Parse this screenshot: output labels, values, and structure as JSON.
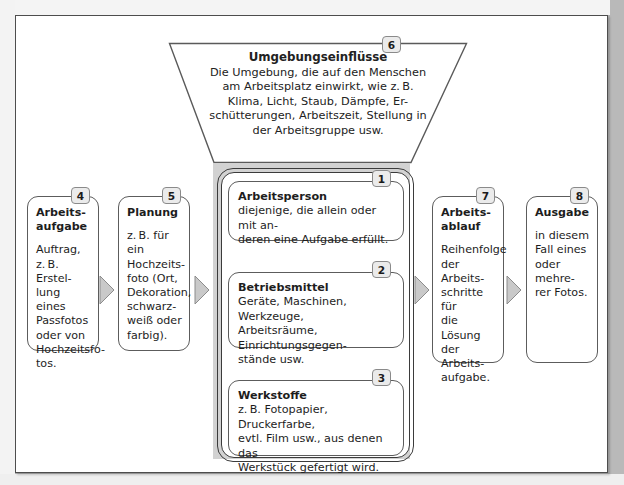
{
  "diagram": {
    "title_semantic": "arbeitssystem-diagramm",
    "colors": {
      "page_background": "#b4b4b4",
      "sheet": "#ffffff",
      "band_gray": "#d2d2d2",
      "badge_fill": "#ebebeb",
      "arrow_fill": "#c8c8c8",
      "line": "#3b3b3b"
    }
  },
  "environment": {
    "badge": "6",
    "title": "Umgebungseinflüsse",
    "lines": [
      "Die Umgebung, die auf den Menschen",
      "am Arbeitsplatz einwirkt, wie z. B.",
      "Klima, Licht, Staub, Dämpfe, Er-",
      "schütterungen, Arbeitszeit, Stellung in",
      "der Arbeitsgruppe usw."
    ]
  },
  "left_column": [
    {
      "badge": "4",
      "title_lines": [
        "Arbeits-",
        "aufgabe"
      ],
      "text_lines": [
        "Auftrag,",
        "z. B. Erstel-",
        "lung eines",
        "Passfotos",
        "oder von",
        "Hochzeitsfo-",
        "tos."
      ]
    },
    {
      "badge": "5",
      "title_lines": [
        "Planung"
      ],
      "text_lines": [
        "z. B. für ein",
        "Hochzeits-",
        "foto (Ort,",
        "Dekoration,",
        "schwarz-",
        "weiß oder",
        "farbig)."
      ]
    }
  ],
  "center_column": [
    {
      "badge": "1",
      "title": "Arbeitsperson",
      "text_lines": [
        "diejenige, die allein oder mit an-",
        "deren eine Aufgabe erfüllt."
      ]
    },
    {
      "badge": "2",
      "title": "Betriebsmittel",
      "text_lines": [
        "Geräte, Maschinen, Werkzeuge,",
        "Arbeitsräume, Einrichtungsgegen-",
        "stände usw."
      ]
    },
    {
      "badge": "3",
      "title": "Werkstoffe",
      "text_lines": [
        "z. B. Fotopapier, Druckerfarbe,",
        "evtl. Film usw., aus denen das",
        "Werkstück gefertigt wird."
      ]
    }
  ],
  "right_column": [
    {
      "badge": "7",
      "title_lines": [
        "Arbeits-",
        "ablauf"
      ],
      "text_lines": [
        "Reihenfolge",
        "der Arbeits-",
        "schritte für",
        "die Lösung",
        "der Arbeits-",
        "aufgabe."
      ]
    },
    {
      "badge": "8",
      "title_lines": [
        "Ausgabe"
      ],
      "text_lines": [
        "in diesem",
        "Fall eines",
        "oder mehre-",
        "rer Fotos."
      ]
    }
  ],
  "arrows": [
    {
      "name": "arrow-aufgabe-to-planung"
    },
    {
      "name": "arrow-planung-to-system"
    },
    {
      "name": "arrow-system-to-ablauf"
    },
    {
      "name": "arrow-ablauf-to-ausgabe"
    }
  ]
}
